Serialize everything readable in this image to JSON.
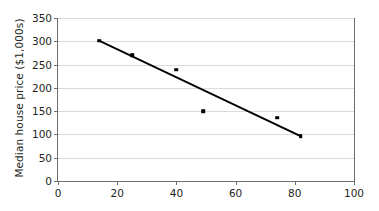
{
  "chart_data": {
    "type": "scatter",
    "title": "",
    "xlabel": "",
    "ylabel": "Median house price ($1,000s)",
    "xlim": [
      0,
      100
    ],
    "ylim": [
      0,
      350
    ],
    "xticks": [
      0,
      20,
      40,
      60,
      80,
      100
    ],
    "yticks": [
      0,
      50,
      100,
      150,
      200,
      250,
      300,
      350
    ],
    "xtick_labels": [
      "0",
      "20",
      "40",
      "60",
      "80",
      "100"
    ],
    "ytick_labels": [
      "0",
      "50",
      "100",
      "150",
      "200",
      "250",
      "300",
      "350"
    ],
    "grid": "horizontal",
    "legend": "none",
    "points": [
      {
        "x": 14,
        "y": 301
      },
      {
        "x": 25,
        "y": 270
      },
      {
        "x": 40,
        "y": 239
      },
      {
        "x": 49,
        "y": 150
      },
      {
        "x": 74,
        "y": 136
      },
      {
        "x": 82,
        "y": 96
      }
    ],
    "series": [
      {
        "name": "Median house price",
        "x": [
          14,
          25,
          40,
          49,
          74,
          82
        ],
        "values": [
          301,
          270,
          239,
          150,
          136,
          96
        ]
      }
    ],
    "trend_line": {
      "name": "line of best fit",
      "x_start": 14,
      "y_start": 301,
      "x_end": 82,
      "y_end": 96
    },
    "colors": {
      "marker": "#000000",
      "trend_line": "#000000",
      "gridline": "#d9dadb",
      "axis": "#6d6e71",
      "text": "#231f20",
      "background": "#ffffff"
    }
  }
}
